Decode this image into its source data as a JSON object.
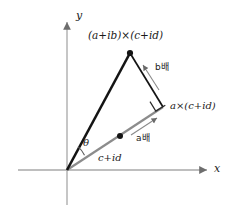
{
  "figure": {
    "axes": {
      "x_label": "x",
      "y_label": "y",
      "color": "#a8a8a8",
      "origin": [
        67,
        170
      ]
    },
    "colors": {
      "vector_black": "#141414",
      "vector_gray": "#8c8c8c",
      "annotation_gray": "#8a8a8a",
      "text": "#1a1a1a"
    },
    "labels": {
      "product": "(a+ib)×(c+id)",
      "a_times": "a×(c+id)",
      "base_vector": "c+id",
      "a_scale": "a배",
      "b_scale": "b배",
      "angle": "θ"
    },
    "points": {
      "origin": [
        67,
        170
      ],
      "apex": [
        130,
        53
      ],
      "right_vertex": [
        163,
        107
      ],
      "midpoint_dot": [
        120,
        136
      ]
    }
  }
}
